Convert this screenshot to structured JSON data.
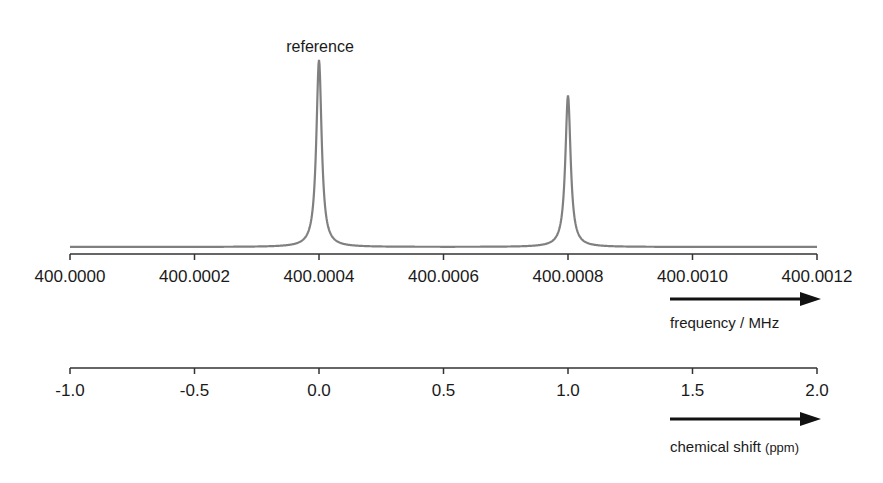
{
  "chart_data": {
    "type": "line",
    "title": "",
    "annotations": [
      {
        "text": "reference",
        "x_ppm": 0.0
      }
    ],
    "spectrum": {
      "peaks": [
        {
          "label": "reference",
          "frequency_MHz": 400.0004,
          "shift_ppm": 0.0,
          "relative_height": 1.0
        },
        {
          "label": "",
          "frequency_MHz": 400.0008,
          "shift_ppm": 1.0,
          "relative_height": 0.81
        }
      ],
      "line_color": "#808080"
    },
    "axes": [
      {
        "name": "frequency",
        "label": "frequency / MHz",
        "range": [
          400.0,
          400.0012
        ],
        "ticks": [
          "400.0000",
          "400.0002",
          "400.0004",
          "400.0006",
          "400.0008",
          "400.0010",
          "400.0012"
        ],
        "arrow_direction": "right"
      },
      {
        "name": "chemical_shift",
        "label": "chemical shift (ppm)",
        "range": [
          -1.0,
          2.0
        ],
        "ticks": [
          "-1.0",
          "-0.5",
          "0.0",
          "0.5",
          "1.0",
          "1.5",
          "2.0"
        ],
        "arrow_direction": "right"
      }
    ],
    "grid": false,
    "legend": null
  },
  "labels": {
    "reference": "reference",
    "freq_title": "frequency / MHz",
    "shift_title_main": "chemical shift ",
    "shift_title_unit": "(ppm)"
  }
}
